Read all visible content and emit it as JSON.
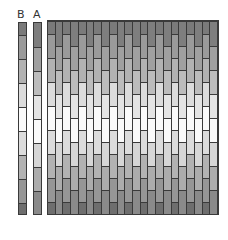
{
  "labels": {
    "b": "B",
    "a": "A"
  },
  "strip_b": {
    "segments": [
      {
        "height": 12,
        "color": "#7a7a7a"
      },
      {
        "height": 24,
        "color": "#9a9a9a"
      },
      {
        "height": 24,
        "color": "#b2b2b2"
      },
      {
        "height": 24,
        "color": "#dcdcdc"
      },
      {
        "height": 24,
        "color": "#fafafa"
      },
      {
        "height": 24,
        "color": "#dcdcdc"
      },
      {
        "height": 24,
        "color": "#b2b2b2"
      },
      {
        "height": 24,
        "color": "#969696"
      },
      {
        "height": 13,
        "color": "#6e6e6e"
      }
    ]
  },
  "strip_a": {
    "segments": [
      {
        "height": 24,
        "color": "#7e7e7e"
      },
      {
        "height": 24,
        "color": "#a0a0a0"
      },
      {
        "height": 24,
        "color": "#bcbcbc"
      },
      {
        "height": 24,
        "color": "#e4e4e4"
      },
      {
        "height": 24,
        "color": "#fafafa"
      },
      {
        "height": 24,
        "color": "#d6d6d6"
      },
      {
        "height": 24,
        "color": "#acacac"
      },
      {
        "height": 25,
        "color": "#8a8a8a"
      }
    ]
  },
  "grid": {
    "columns": 22,
    "pattern": [
      "B",
      "A"
    ]
  }
}
